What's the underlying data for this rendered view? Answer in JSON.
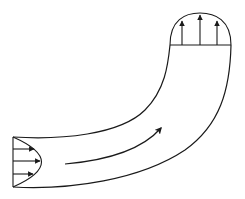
{
  "diagram": {
    "type": "fluid-flow-schematic",
    "stroke_color": "#1a1a1a",
    "background_color": "#ffffff",
    "elements": {
      "pipe": {
        "label": "curved pipe",
        "shape": "bend"
      },
      "inlet_profile": {
        "label": "inlet velocity profile",
        "shape": "parabolic",
        "arrow_count": 3
      },
      "outlet_profile": {
        "label": "outlet velocity profile",
        "shape": "dome",
        "arrow_count": 3
      },
      "flow_direction": {
        "label": "flow direction arrow"
      }
    }
  }
}
